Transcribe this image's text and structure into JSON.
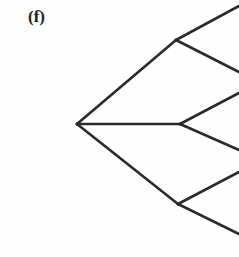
{
  "figure": {
    "panel_label": "(f)",
    "caption_text": "",
    "background_color": "#fefefe",
    "line_color": "#2a2a28",
    "line_width": 2.6,
    "width": 239,
    "height": 257
  },
  "chart_data": {
    "type": "diagram",
    "diagram_kind": "tree-graph",
    "title": "(f)",
    "xlabel": "",
    "ylabel": "",
    "grid": false,
    "legend": "none",
    "xlim": [
      0,
      239
    ],
    "ylim": [
      0,
      257
    ],
    "nodes": [
      {
        "id": "root",
        "label": "",
        "x": 77,
        "y": 124,
        "level": 0,
        "degree": 3
      },
      {
        "id": "n-top",
        "label": "",
        "x": 176,
        "y": 40,
        "level": 1,
        "degree": 3
      },
      {
        "id": "n-mid",
        "label": "",
        "x": 180,
        "y": 124,
        "level": 1,
        "degree": 3
      },
      {
        "id": "n-bot",
        "label": "",
        "x": 178,
        "y": 204,
        "level": 1,
        "degree": 3
      },
      {
        "id": "leaf-1",
        "label": "",
        "x": 239,
        "y": 6,
        "level": 2,
        "degree": 1
      },
      {
        "id": "leaf-2",
        "label": "",
        "x": 239,
        "y": 72,
        "level": 2,
        "degree": 1
      },
      {
        "id": "leaf-3",
        "label": "",
        "x": 239,
        "y": 93,
        "level": 2,
        "degree": 1
      },
      {
        "id": "leaf-4",
        "label": "",
        "x": 239,
        "y": 150,
        "level": 2,
        "degree": 1
      },
      {
        "id": "leaf-5",
        "label": "",
        "x": 239,
        "y": 172,
        "level": 2,
        "degree": 1
      },
      {
        "id": "leaf-6",
        "label": "",
        "x": 239,
        "y": 234,
        "level": 2,
        "degree": 1
      }
    ],
    "edges": [
      {
        "id": "e-root-top",
        "from": "root",
        "to": "n-top",
        "x1": 77,
        "y1": 124,
        "x2": 176,
        "y2": 40
      },
      {
        "id": "e-root-mid",
        "from": "root",
        "to": "n-mid",
        "x1": 77,
        "y1": 124,
        "x2": 180,
        "y2": 124
      },
      {
        "id": "e-root-bot",
        "from": "root",
        "to": "n-bot",
        "x1": 77,
        "y1": 124,
        "x2": 178,
        "y2": 204
      },
      {
        "id": "e-top-a",
        "from": "n-top",
        "to": "leaf-1",
        "x1": 176,
        "y1": 40,
        "x2": 239,
        "y2": 6
      },
      {
        "id": "e-top-b",
        "from": "n-top",
        "to": "leaf-2",
        "x1": 176,
        "y1": 40,
        "x2": 239,
        "y2": 72
      },
      {
        "id": "e-mid-a",
        "from": "n-mid",
        "to": "leaf-3",
        "x1": 180,
        "y1": 124,
        "x2": 239,
        "y2": 93
      },
      {
        "id": "e-mid-b",
        "from": "n-mid",
        "to": "leaf-4",
        "x1": 180,
        "y1": 124,
        "x2": 239,
        "y2": 150
      },
      {
        "id": "e-bot-a",
        "from": "n-bot",
        "to": "leaf-5",
        "x1": 178,
        "y1": 204,
        "x2": 239,
        "y2": 172
      },
      {
        "id": "e-bot-b",
        "from": "n-bot",
        "to": "leaf-6",
        "x1": 178,
        "y1": 204,
        "x2": 239,
        "y2": 234
      }
    ]
  }
}
